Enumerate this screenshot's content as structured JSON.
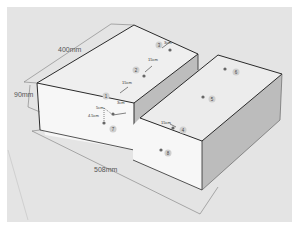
{
  "diagram": {
    "type": "isometric-box-drawing",
    "colors": {
      "background": "#e4e4e4",
      "top_face": "#efefef",
      "front_face": "#f7f7f7",
      "side_face": "#b9b9b9",
      "edge": "#2a2a2a",
      "dimension_line": "#666666",
      "marker": "#777777"
    },
    "dimensions": {
      "length_top": "400mm",
      "height": "90mm",
      "length_bottom": "508mm"
    },
    "local_dimensions": {
      "d1": "5cm",
      "d2": "15cm",
      "d3": "15cm",
      "d4": "3cm",
      "d5": "3cm",
      "d6": "4.5cm",
      "d7": "15cm"
    },
    "markers": [
      "1",
      "2",
      "3",
      "4",
      "5",
      "6",
      "7",
      "8"
    ]
  }
}
